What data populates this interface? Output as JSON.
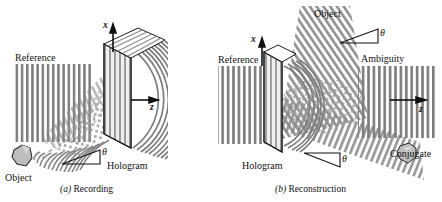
{
  "figure": {
    "background": "#ffffff",
    "fringe_color": "#7d7d7d",
    "fringe_color_light": "#9a9a9a",
    "line_color": "#1a1a1a",
    "object_fill": "#b8b8b8",
    "plate_fill": "#e8e8e8",
    "width": 442,
    "height": 202
  },
  "panel_a": {
    "caption_marker": "(a)",
    "caption_text": "Recording",
    "labels": {
      "reference": "Reference",
      "object": "Object",
      "hologram": "Hologram",
      "theta": "θ",
      "axis_x": "x",
      "axis_z": "z"
    }
  },
  "panel_b": {
    "caption_marker": "(b)",
    "caption_text": "Reconstruction",
    "labels": {
      "reference": "Reference",
      "object": "Object",
      "hologram": "Hologram",
      "ambiguity": "Ambiguity",
      "conjugate": "Conjugate",
      "theta_top": "θ",
      "theta_bottom": "θ",
      "axis_x": "x",
      "axis_z": "z"
    }
  }
}
